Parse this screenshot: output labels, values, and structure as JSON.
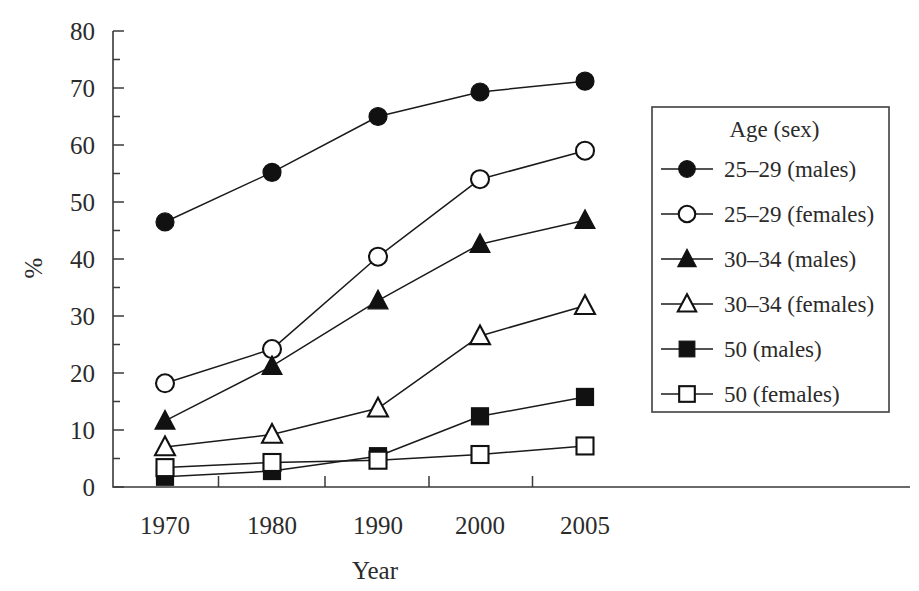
{
  "chart_data": {
    "type": "line",
    "title": "",
    "subtitle": "",
    "xlabel": "Year",
    "ylabel": "%",
    "categories": [
      "1970",
      "1980",
      "1990",
      "2000",
      "2005"
    ],
    "x": [
      1970,
      1980,
      1990,
      2000,
      2005
    ],
    "xtick_labels": [
      "1970",
      "1980",
      "1990",
      "2000",
      "2005"
    ],
    "ytick_labels": [
      "0",
      "10",
      "20",
      "30",
      "40",
      "50",
      "60",
      "70",
      "80"
    ],
    "ytick_values": [
      0,
      10,
      20,
      30,
      40,
      50,
      60,
      70,
      80
    ],
    "ylim": [
      0,
      80
    ],
    "grid": false,
    "legend_position": "right",
    "legend_title": "Age (sex)",
    "series": [
      {
        "name": "25–29 (males)",
        "marker": "filled-circle",
        "values": [
          46.5,
          55.2,
          65.0,
          69.3,
          71.2
        ]
      },
      {
        "name": "25–29 (females)",
        "marker": "open-circle",
        "values": [
          18.2,
          24.2,
          40.4,
          54.0,
          59.0
        ]
      },
      {
        "name": "30–34 (males)",
        "marker": "filled-triangle",
        "values": [
          11.6,
          21.2,
          32.7,
          42.6,
          46.8
        ]
      },
      {
        "name": "30–34 (females)",
        "marker": "open-triangle",
        "values": [
          7.0,
          9.2,
          13.8,
          26.5,
          31.8
        ]
      },
      {
        "name": "50 (males)",
        "marker": "filled-square",
        "values": [
          1.8,
          2.8,
          5.4,
          12.4,
          15.8
        ]
      },
      {
        "name": "50 (females)",
        "marker": "open-square",
        "values": [
          3.4,
          4.3,
          4.7,
          5.7,
          7.2
        ]
      }
    ],
    "colors": {
      "line": "#1a1a1a",
      "marker_fill": "#111111",
      "marker_open_fill": "#ffffff",
      "axis": "#3a3a3a",
      "text": "#2b2b2b",
      "background": "#ffffff"
    }
  }
}
